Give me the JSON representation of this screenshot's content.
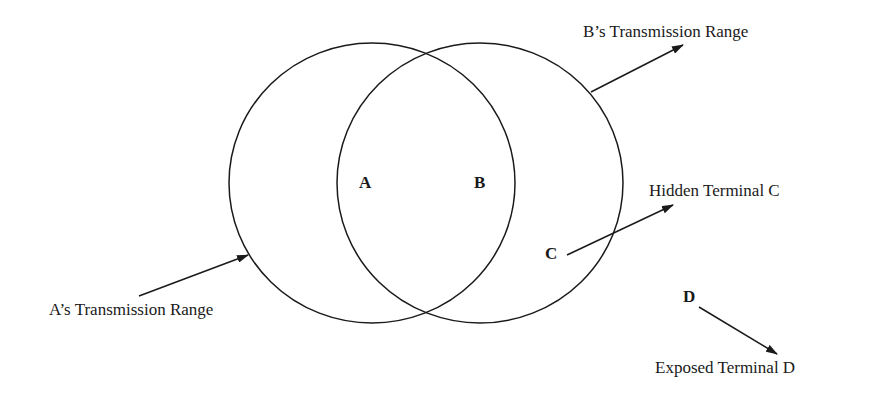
{
  "diagram": {
    "title": "",
    "nodes": [
      {
        "id": "A",
        "label": "A"
      },
      {
        "id": "B",
        "label": "B"
      },
      {
        "id": "C",
        "label": "C"
      },
      {
        "id": "D",
        "label": "D"
      }
    ],
    "annotations": {
      "b_range": "B’s Transmission Range",
      "hidden": "Hidden Terminal C",
      "a_range": "A’s Transmission Range",
      "exposed": "Exposed Terminal D"
    },
    "colors": {
      "stroke": "#1a1a1a",
      "background": "#ffffff"
    }
  }
}
